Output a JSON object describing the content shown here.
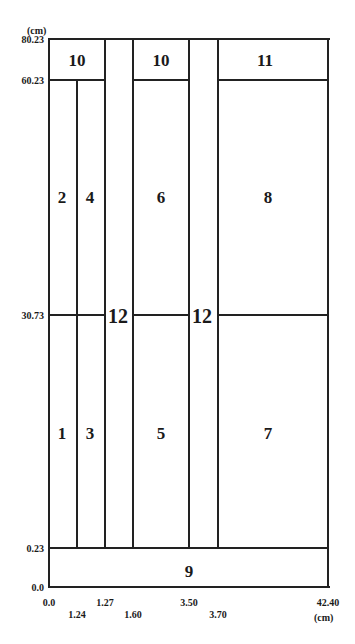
{
  "diagram": {
    "units": {
      "y_unit": "(cm)",
      "x_unit": "(cm)"
    },
    "y_ticks": [
      "80.23",
      "60.23",
      "30.73",
      "0.23",
      "0.0"
    ],
    "x_ticks_row1": [
      "0.0",
      "1.27",
      "3.50",
      "42.40"
    ],
    "x_ticks_row2": [
      "1.24",
      "1.60",
      "3.70"
    ],
    "regions": [
      {
        "id": "1",
        "label": "1"
      },
      {
        "id": "2",
        "label": "2"
      },
      {
        "id": "3",
        "label": "3"
      },
      {
        "id": "4",
        "label": "4"
      },
      {
        "id": "5",
        "label": "5"
      },
      {
        "id": "6",
        "label": "6"
      },
      {
        "id": "7",
        "label": "7"
      },
      {
        "id": "8",
        "label": "8"
      },
      {
        "id": "9",
        "label": "9"
      },
      {
        "id": "10a",
        "label": "10"
      },
      {
        "id": "10b",
        "label": "10"
      },
      {
        "id": "11",
        "label": "11"
      },
      {
        "id": "12a",
        "label": "12"
      },
      {
        "id": "12b",
        "label": "12"
      }
    ]
  }
}
